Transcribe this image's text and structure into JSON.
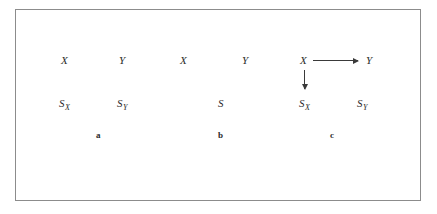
{
  "figure": {
    "background_color": "#ffffff",
    "border_color": "#8c8c8c",
    "text_color": "#2b2b2b",
    "arrow_color": "#3a3a3a"
  },
  "panels": [
    {
      "id": "a",
      "label": "a",
      "nodes": {
        "top_left": "X",
        "top_right": "Y",
        "bottom_left_base": "S",
        "bottom_left_sub": "X",
        "bottom_right_base": "S",
        "bottom_right_sub": "Y"
      },
      "arrows": []
    },
    {
      "id": "b",
      "label": "b",
      "nodes": {
        "top_left": "X",
        "top_right": "Y",
        "bottom_center": "S"
      },
      "arrows": []
    },
    {
      "id": "c",
      "label": "c",
      "nodes": {
        "top_left": "X",
        "top_right": "Y",
        "bottom_left_base": "S",
        "bottom_left_sub": "X",
        "bottom_right_base": "S",
        "bottom_right_sub": "Y"
      },
      "arrows": [
        {
          "name": "x-to-y",
          "direction": "right",
          "from": "X",
          "to": "Y"
        },
        {
          "name": "x-to-sx",
          "direction": "down",
          "from": "X",
          "to": "S_X"
        }
      ]
    }
  ]
}
